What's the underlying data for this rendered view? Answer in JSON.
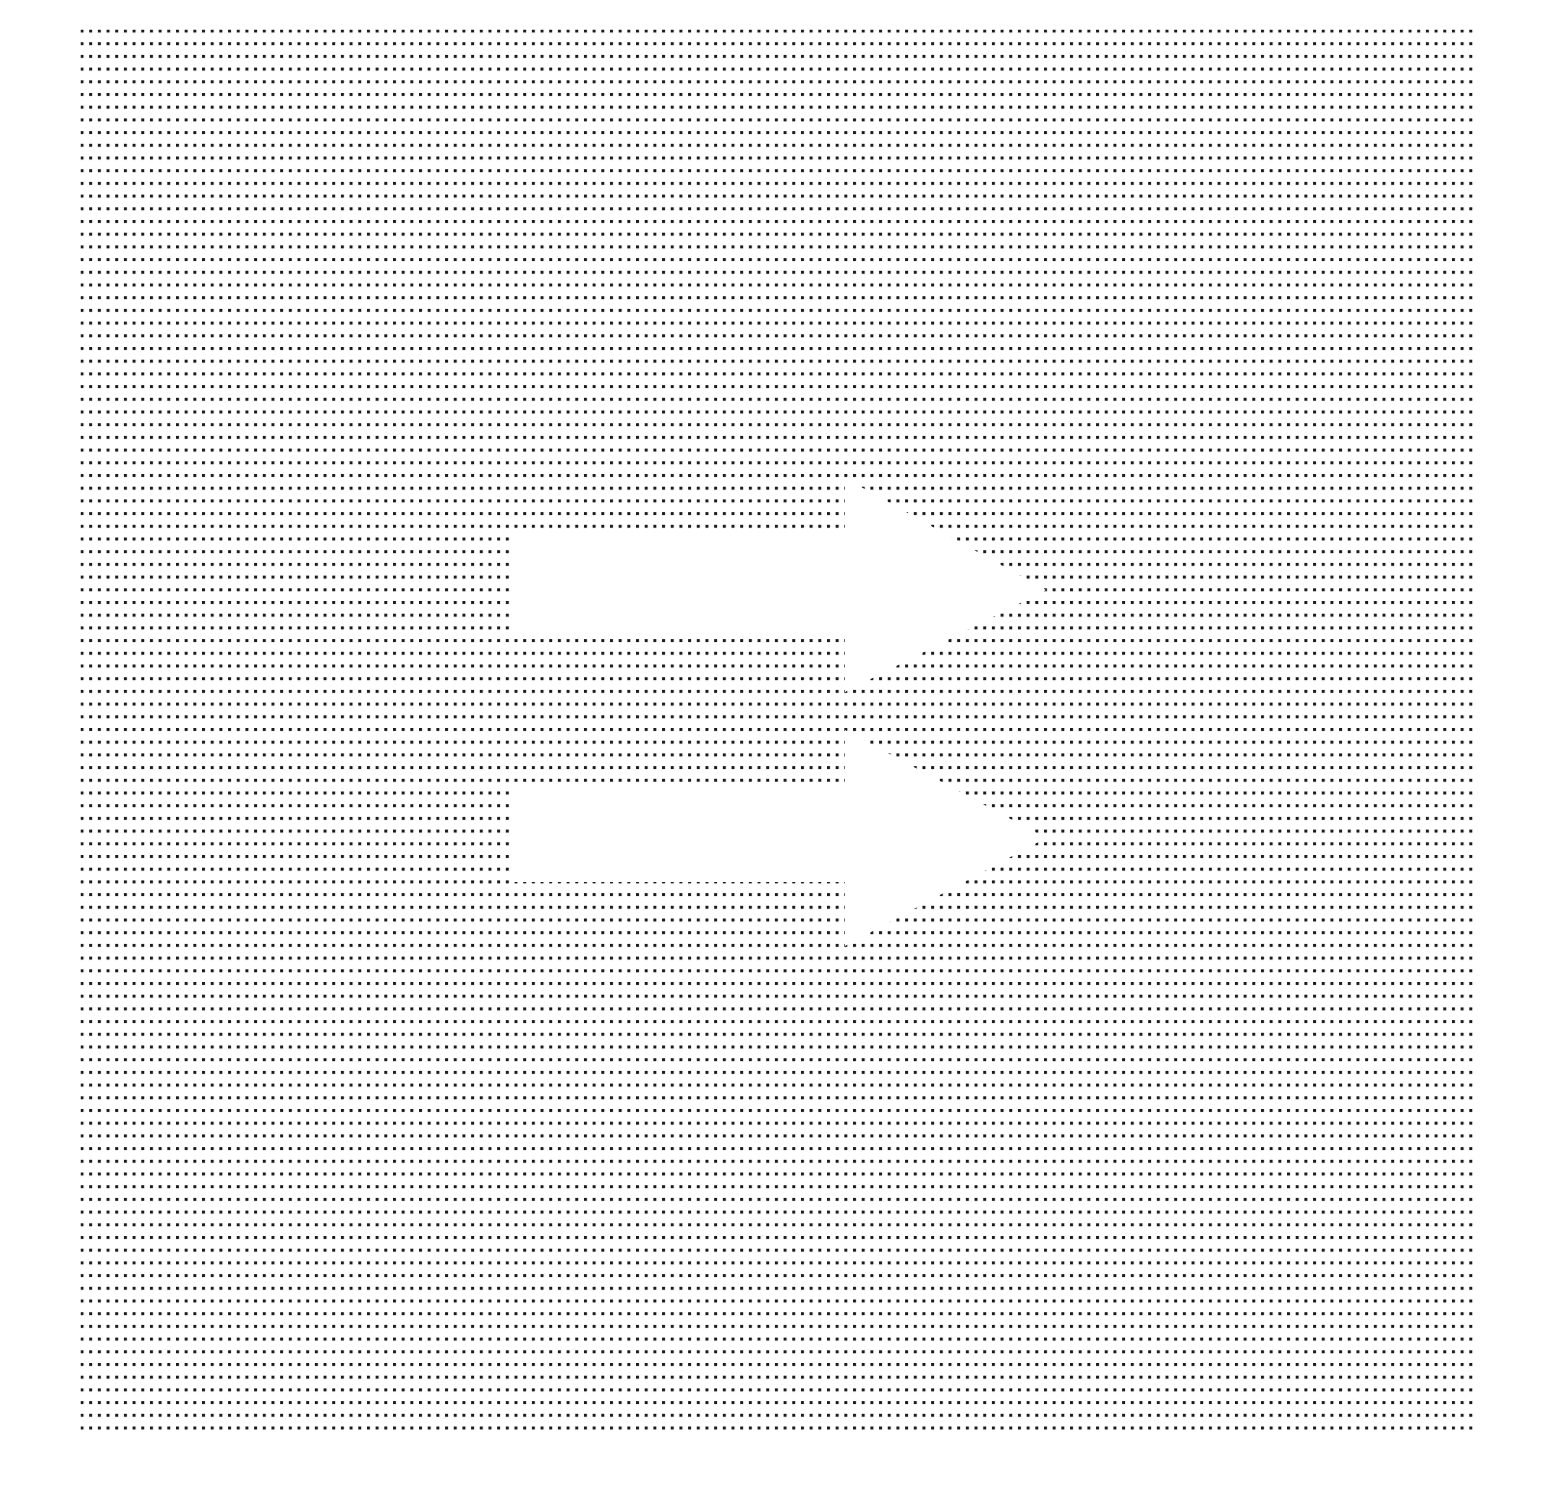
{
  "figure": {
    "background_color": "#ffffff",
    "dot_color": "#1a1a1a"
  },
  "dot_grid": {
    "x_start": 82,
    "y_start": 31,
    "x_end": 1472,
    "y_end": 1432,
    "spacing_x": 8.68,
    "spacing_y": 12.7,
    "dot_size": 3
  },
  "arrows": [
    {
      "label": "arrow-top",
      "direction": "right",
      "shaft_x_start": 513,
      "shaft_x_end": 845,
      "shaft_y_top": 530,
      "shaft_y_bottom": 632,
      "head_y_top": 478,
      "head_y_bottom": 692,
      "tip_x": 1046,
      "tip_y": 590
    },
    {
      "label": "arrow-bottom",
      "direction": "right",
      "shaft_x_start": 513,
      "shaft_x_end": 845,
      "shaft_y_top": 782,
      "shaft_y_bottom": 882,
      "head_y_top": 730,
      "head_y_bottom": 946,
      "tip_x": 1046,
      "tip_y": 838
    }
  ]
}
